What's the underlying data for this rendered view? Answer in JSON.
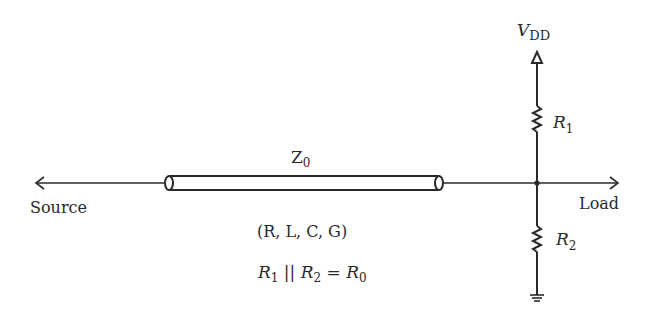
{
  "diagram": {
    "type": "transmission-line termination circuit",
    "supply": {
      "symbol": "V",
      "subscript": "DD"
    },
    "resistors": [
      {
        "symbol": "R",
        "subscript": "1",
        "position": "pull-up to VDD"
      },
      {
        "symbol": "R",
        "subscript": "2",
        "position": "pull-down to ground"
      }
    ],
    "line": {
      "symbol": "Z",
      "subscript": "0",
      "params": "(R, L, C, G)"
    },
    "source_label": "Source",
    "load_label": "Load",
    "equation": {
      "r1": "R",
      "r1_sub": "1",
      "op": " || ",
      "r2": "R",
      "r2_sub": "2",
      "eq": " = ",
      "r0": "R",
      "r0_sub": "0"
    },
    "colors": {
      "stroke": "#2a2a2a",
      "background": "#ffffff"
    }
  }
}
